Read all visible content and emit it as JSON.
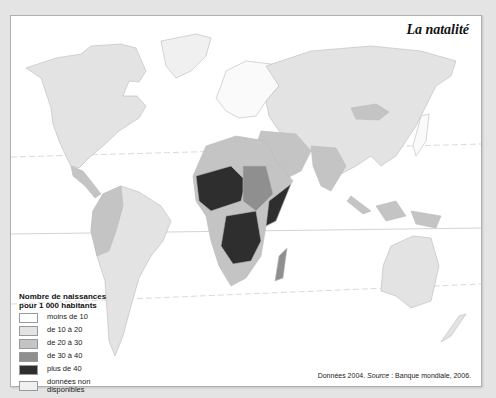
{
  "title": "La natalité",
  "legend": {
    "title_line1": "Nombre de naissances",
    "title_line2": "pour 1 000 habitants",
    "items": [
      {
        "label": "moins de 10",
        "color": "#ffffff"
      },
      {
        "label": "de 10 à 20",
        "color": "#e3e3e3"
      },
      {
        "label": "de 20 à 30",
        "color": "#c4c4c4"
      },
      {
        "label": "de 30 à 40",
        "color": "#8f8f8f"
      },
      {
        "label": "plus de 40",
        "color": "#2e2e2e"
      },
      {
        "label": "données non disponibles",
        "color": "#f0f0f0"
      }
    ]
  },
  "source": {
    "prefix": "Données 2004. ",
    "label": "Source",
    "text": " : Banque mondiale, 2006."
  }
}
